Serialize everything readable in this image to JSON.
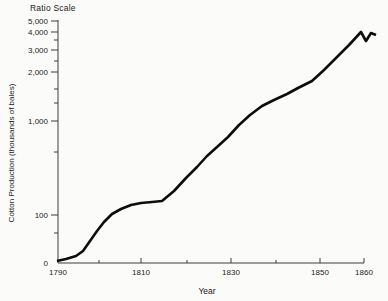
{
  "chart": {
    "title": "Ratio Scale",
    "xlabel": "Year",
    "ylabel": "Cotton Production (thousands of bales)"
  },
  "chart_data": {
    "type": "line",
    "title": "Ratio Scale",
    "xlabel": "Year",
    "ylabel": "Cotton Production (thousands of bales)",
    "y_scale": "ratio (logarithmic)",
    "x": [
      1790,
      1795,
      1800,
      1805,
      1810,
      1815,
      1820,
      1825,
      1830,
      1835,
      1840,
      1845,
      1850,
      1855,
      1858,
      1859,
      1860
    ],
    "values": [
      4,
      20,
      75,
      115,
      125,
      140,
      300,
      470,
      780,
      1150,
      1400,
      1700,
      2000,
      2900,
      4100,
      3500,
      4000
    ],
    "xlim": [
      1790,
      1860
    ],
    "ylim": [
      0,
      5000
    ],
    "x_tick_labels": [
      "1790",
      "1810",
      "1830",
      "1850",
      "1860"
    ],
    "y_tick_labels": [
      "0",
      "100",
      "1,000",
      "2,000",
      "3,000",
      "4,000",
      "5,000"
    ],
    "grid": false,
    "legend": false,
    "series_color": "#0d0d0d"
  },
  "layout": {
    "width": 388,
    "height": 301,
    "plot": {
      "x0": 58,
      "y0": 263,
      "x1": 364,
      "ytop": 20
    },
    "colors": {
      "line": "#0d0d0d",
      "axis": "#3c3c3c",
      "text": "#1c1c1c",
      "background": "#fbfbf9"
    },
    "y_ticks": [
      {
        "label": "5,000",
        "y": 21,
        "tick": true
      },
      {
        "label": "4,000",
        "y": 32,
        "tick": true
      },
      {
        "label": "",
        "y": 40,
        "tick": true
      },
      {
        "label": "3,000",
        "y": 50,
        "tick": true
      },
      {
        "label": "",
        "y": 61,
        "tick": true
      },
      {
        "label": "2,000",
        "y": 72,
        "tick": true
      },
      {
        "label": "",
        "y": 89,
        "tick": true
      },
      {
        "label": "",
        "y": 103,
        "tick": true
      },
      {
        "label": "1,000",
        "y": 121,
        "tick": true
      },
      {
        "label": "",
        "y": 152,
        "tick": true
      },
      {
        "label": "100",
        "y": 215,
        "tick": true
      },
      {
        "label": "",
        "y": 233,
        "tick": true
      },
      {
        "label": "0",
        "y": 263,
        "tick": false
      }
    ],
    "x_ticks": [
      {
        "label": "1790",
        "x": 58,
        "tick": false
      },
      {
        "label": "",
        "x": 99,
        "tick": true
      },
      {
        "label": "1810",
        "x": 141,
        "tick": true
      },
      {
        "label": "",
        "x": 187,
        "tick": true
      },
      {
        "label": "1830",
        "x": 231,
        "tick": true
      },
      {
        "label": "",
        "x": 276,
        "tick": true
      },
      {
        "label": "1850",
        "x": 320,
        "tick": true
      },
      {
        "label": "1860",
        "x": 364,
        "tick": true
      }
    ],
    "line_px": [
      [
        57,
        261
      ],
      [
        66,
        259
      ],
      [
        76,
        256
      ],
      [
        83,
        251
      ],
      [
        90,
        241
      ],
      [
        97,
        231
      ],
      [
        104,
        222
      ],
      [
        112,
        214
      ],
      [
        121,
        209
      ],
      [
        131,
        205
      ],
      [
        141,
        203
      ],
      [
        152,
        202
      ],
      [
        162,
        201
      ],
      [
        174,
        191
      ],
      [
        186,
        178
      ],
      [
        197,
        167
      ],
      [
        207,
        156
      ],
      [
        217,
        147
      ],
      [
        228,
        137
      ],
      [
        239,
        125
      ],
      [
        250,
        115
      ],
      [
        262,
        106
      ],
      [
        274,
        100
      ],
      [
        287,
        94
      ],
      [
        298,
        88
      ],
      [
        312,
        81
      ],
      [
        324,
        70
      ],
      [
        336,
        58
      ],
      [
        349,
        45
      ],
      [
        361,
        32
      ],
      [
        366,
        41
      ],
      [
        371,
        33
      ],
      [
        376,
        35
      ]
    ]
  }
}
